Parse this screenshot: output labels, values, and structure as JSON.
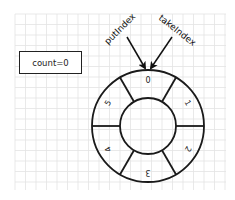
{
  "diagram": {
    "title": "",
    "count_label": "count=0",
    "ring": {
      "center": [
        148,
        126
      ],
      "outer_radius": 56,
      "inner_radius": 28,
      "slots": [
        {
          "index": 0,
          "label": "0",
          "angle_deg": -90,
          "rotation_deg": 0
        },
        {
          "index": 1,
          "label": "1",
          "angle_deg": -30,
          "rotation_deg": 60
        },
        {
          "index": 2,
          "label": "2",
          "angle_deg": 30,
          "rotation_deg": 120
        },
        {
          "index": 3,
          "label": "3",
          "angle_deg": 90,
          "rotation_deg": 180
        },
        {
          "index": 4,
          "label": "4",
          "angle_deg": 150,
          "rotation_deg": 240
        },
        {
          "index": 5,
          "label": "5",
          "angle_deg": 210,
          "rotation_deg": 300
        }
      ]
    },
    "pointers": [
      {
        "name": "putIndex",
        "label": "putIndex",
        "points_to_slot": 0
      },
      {
        "name": "takeIndex",
        "label": "takeIndex",
        "points_to_slot": 0
      }
    ],
    "colors": {
      "stroke": "#1a1a1a",
      "grid": "#e3e3e3",
      "background": "#ffffff"
    }
  }
}
